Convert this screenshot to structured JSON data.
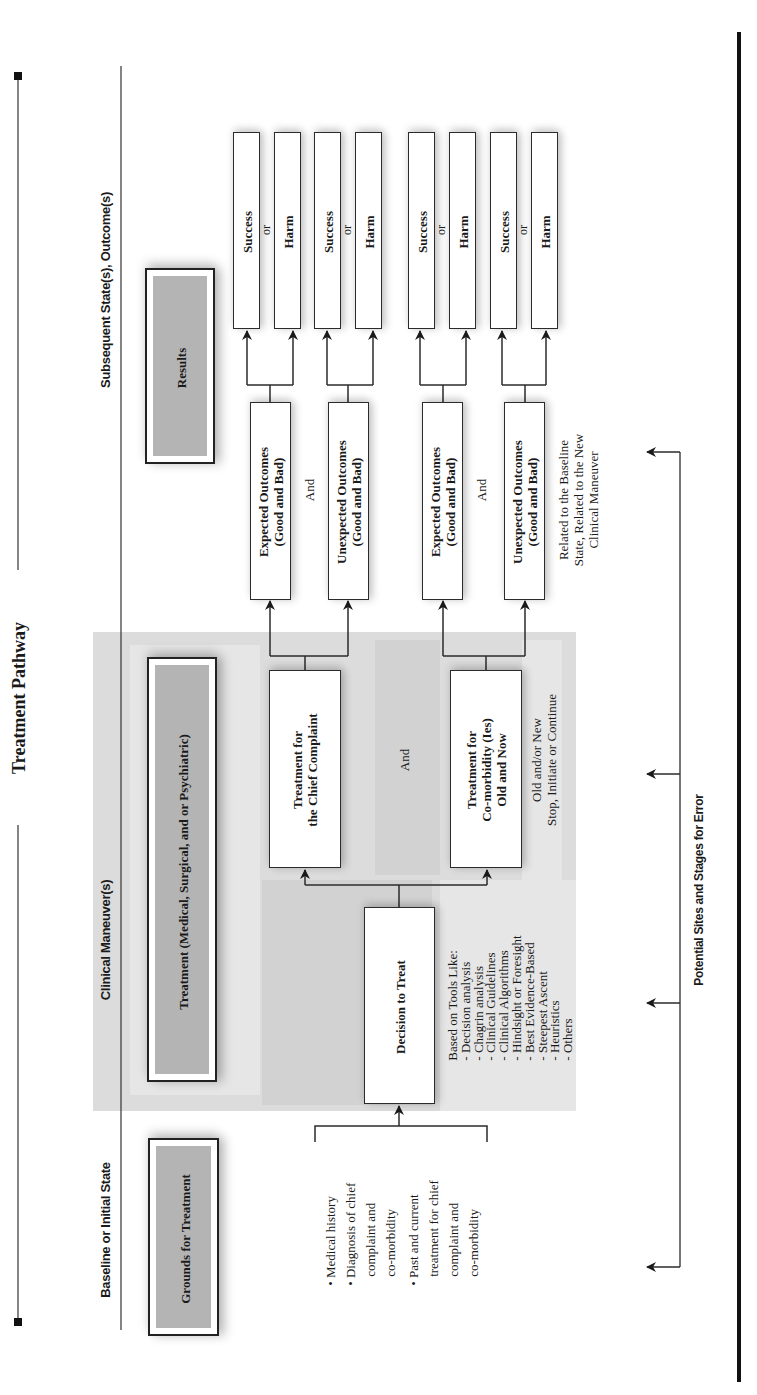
{
  "title": "Treatment Pathway",
  "orientation": "rotated -90deg (text reads bottom-to-top)",
  "stages": {
    "baseline": "Baseline or Initial State",
    "clinical": "Clinical Maneuver(s)",
    "subsequent": "Subsequent State(s), Outcome(s)"
  },
  "headers": {
    "grounds": "Grounds for Treatment",
    "treatment": "Treatment (Medical, Surgical, and or Psychiatric)",
    "results": "Results"
  },
  "grounds_list": [
    {
      "bullet": "•",
      "lines": [
        "Medical history"
      ]
    },
    {
      "bullet": "•",
      "lines": [
        "Diagnosis of chief",
        "complaint and",
        "co-morbidity"
      ]
    },
    {
      "bullet": "•",
      "lines": [
        "Past and current",
        "treatment for chief",
        "complaint and",
        "co-morbidity"
      ]
    }
  ],
  "decision": {
    "label": "Decision to Treat",
    "tools_heading": "Based on Tools Like:",
    "tools": [
      "- Decision analysis",
      "- Chagrin analysis",
      "- Clinical Guidelines",
      "- Clinical Algorithms",
      "- Hindsight or Foresight",
      "- Best Evidence-Based",
      "- Steepest Ascent",
      "- Heuristics",
      "- Others"
    ]
  },
  "treatments": {
    "chief": [
      "Treatment for",
      "the Chief Complaint"
    ],
    "and": "And",
    "comorbid": [
      "Treatment for",
      "Co-morbidity (Ies)",
      "Old and Now"
    ],
    "note": [
      "Old and/or New",
      "Stop, Initiate or Continue"
    ]
  },
  "outcomes": {
    "expected": [
      "Expected Outcomes",
      "(Good and Bad)"
    ],
    "unexpected": [
      "Unexpected Outcomes",
      "(Good and Bad)"
    ],
    "and": "And",
    "note": [
      "Related to the Baseline",
      "State, Related to the New",
      "Clinical Maneuver"
    ]
  },
  "results": {
    "success": "Success",
    "or": "or",
    "harm": "Harm"
  },
  "error_label": "Potential Sites and Stages for Error",
  "colors": {
    "shade_light": "#dcdcdc",
    "header_fill": "#b4b4b4",
    "line": "#2b2b2b",
    "rule": "#111111"
  }
}
